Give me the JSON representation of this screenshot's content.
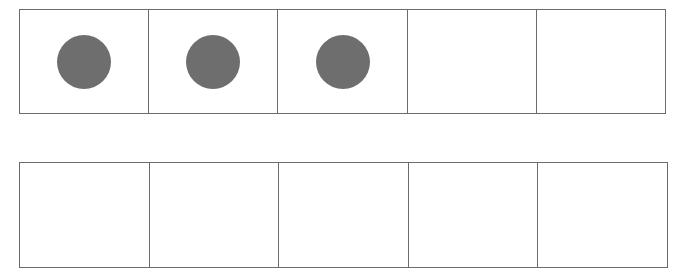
{
  "ten_frame": {
    "rows": [
      {
        "cells": [
          true,
          true,
          true,
          false,
          false
        ]
      },
      {
        "cells": [
          false,
          false,
          false,
          false,
          false
        ]
      }
    ],
    "filled_count": 3,
    "dot_color": "#6e6e6e",
    "line_color": "#6b6b6b"
  }
}
